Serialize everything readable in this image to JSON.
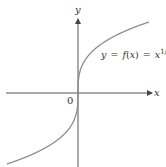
{
  "chart_data": {
    "type": "line",
    "title": "",
    "function_label": "y = f(x) = x^{1/3}",
    "label_parts": {
      "y": "y",
      "eq1": "=",
      "f": "f",
      "paren_open": "(",
      "x_arg": "x",
      "paren_close": ")",
      "eq2": "=",
      "base": "x",
      "exponent": "1/3"
    },
    "xlabel": "x",
    "ylabel": "y",
    "origin_label": "0",
    "series": [
      {
        "name": "f(x) = x^(1/3)",
        "x": [
          -8,
          -6,
          -4,
          -2,
          -1,
          -0.5,
          -0.1,
          0,
          0.1,
          0.5,
          1,
          2,
          4,
          6,
          8
        ],
        "y": [
          -2,
          -1.817,
          -1.587,
          -1.26,
          -1,
          -0.794,
          -0.464,
          0,
          0.464,
          0.794,
          1,
          1.26,
          1.587,
          1.817,
          2
        ]
      }
    ],
    "xlim": [
      -8.5,
      8.5
    ],
    "ylim": [
      -2.2,
      2.2
    ],
    "grid": false,
    "legend": "none",
    "colors": {
      "curve": "#8c8c8c",
      "axes": "#555555",
      "text": "#333333"
    }
  }
}
